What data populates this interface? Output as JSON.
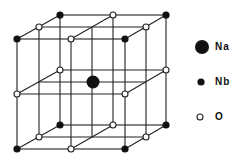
{
  "diagram": {
    "type": "perovskite-unit-cell",
    "colors": {
      "line": "#222222",
      "atom_fill": "#111111",
      "oxygen_fill": "#ffffff"
    },
    "legend": [
      {
        "symbol": "Na",
        "marker": "large-filled-circle"
      },
      {
        "symbol": "Nb",
        "marker": "small-filled-circle"
      },
      {
        "symbol": "O",
        "marker": "open-circle"
      }
    ]
  }
}
